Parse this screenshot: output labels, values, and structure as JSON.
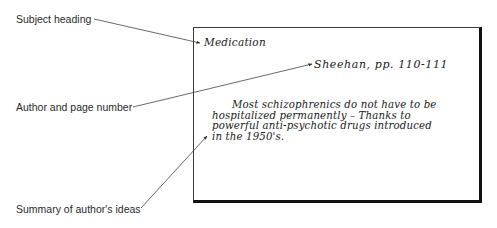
{
  "labels": {
    "subject_heading": "Subject heading",
    "author_and_page": "Author and page number",
    "summary": "Summary of author's ideas"
  },
  "card": {
    "subject": "Medication",
    "author_page": "Sheehan, pp. 110-111",
    "summary_lines": [
      "Most schizophrenics do not have to be",
      "hospitalized permanently – Thanks to",
      "powerful anti-psychotic drugs introduced",
      "in the 1950's."
    ]
  }
}
